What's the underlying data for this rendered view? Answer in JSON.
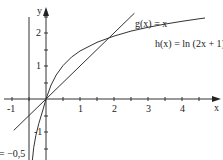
{
  "graph": {
    "axes": {
      "x_label": "x",
      "y_label": "y"
    },
    "x_ticks": [
      {
        "value": -1,
        "label": "-1"
      },
      {
        "value": 1,
        "label": "1"
      },
      {
        "value": 2,
        "label": "2"
      },
      {
        "value": 3,
        "label": "3"
      },
      {
        "value": 4,
        "label": "4"
      }
    ],
    "y_ticks": [
      {
        "value": 2,
        "label": "2"
      },
      {
        "value": 1,
        "label": "1"
      },
      {
        "value": -1,
        "label": "-1"
      }
    ],
    "functions": [
      {
        "name": "g",
        "label": "g(x) = x"
      },
      {
        "name": "h",
        "label": "h(x) = ln (2x + 1)"
      }
    ],
    "asymptote": {
      "label": "= −0,5",
      "x": -0.5
    }
  }
}
